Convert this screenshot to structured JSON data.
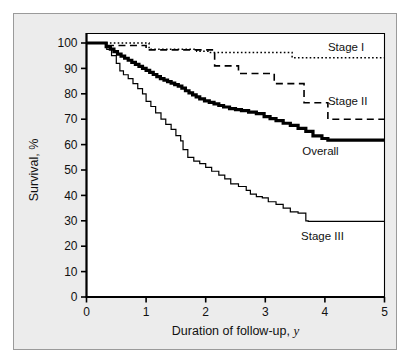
{
  "figure": {
    "background": "#ececec",
    "plot_background": "#ffffff",
    "border_color": "#9a9a9a"
  },
  "chart_data": {
    "type": "line",
    "title": "",
    "subtitle": "",
    "xlabel": "Duration of follow-up, y",
    "xlabel_italic_suffix": "y",
    "ylabel": "Survival, %",
    "xlim": [
      0,
      5
    ],
    "ylim": [
      0,
      100
    ],
    "xticks": [
      0,
      1,
      2,
      3,
      4,
      5
    ],
    "yticks": [
      0,
      10,
      20,
      30,
      40,
      50,
      60,
      70,
      80,
      90,
      100
    ],
    "xticklabels": [
      "0",
      "1",
      "2",
      "3",
      "4",
      "5"
    ],
    "yticklabels": [
      "0",
      "10",
      "20",
      "30",
      "40",
      "50",
      "60",
      "70",
      "80",
      "90",
      "100"
    ],
    "grid": false,
    "legend_position": "inline-annotations",
    "step_type": "post",
    "series": [
      {
        "name": "Stage I",
        "style": "dotted",
        "label": "Stage I",
        "label_x": 4.05,
        "label_y": 98.5,
        "x": [
          0.0,
          0.95,
          1.05,
          1.75,
          1.85,
          2.05,
          3.35,
          3.45,
          5.0
        ],
        "y": [
          100.0,
          100.0,
          97.5,
          97.5,
          96.8,
          96.3,
          96.3,
          94.2,
          94.2
        ]
      },
      {
        "name": "Stage II",
        "style": "dashed",
        "label": "Stage II",
        "label_x": 4.05,
        "label_y": 77.0,
        "x": [
          0.0,
          0.22,
          0.3,
          0.9,
          1.0,
          2.05,
          2.15,
          2.45,
          2.55,
          3.05,
          3.15,
          3.55,
          3.65,
          3.95,
          4.05,
          5.0
        ],
        "y": [
          100.0,
          100.0,
          99.0,
          99.0,
          97.3,
          97.3,
          91.0,
          91.0,
          88.0,
          88.0,
          84.0,
          84.0,
          76.5,
          76.5,
          70.0,
          70.0
        ]
      },
      {
        "name": "Overall",
        "style": "solid-thick",
        "label": "Overall",
        "label_x": 3.62,
        "label_y": 57.5,
        "x": [
          0.0,
          0.28,
          0.33,
          0.4,
          0.46,
          0.52,
          0.58,
          0.64,
          0.7,
          0.76,
          0.82,
          0.88,
          0.94,
          1.0,
          1.06,
          1.12,
          1.18,
          1.24,
          1.3,
          1.36,
          1.42,
          1.48,
          1.54,
          1.6,
          1.66,
          1.72,
          1.78,
          1.84,
          1.9,
          1.98,
          2.06,
          2.14,
          2.22,
          2.3,
          2.4,
          2.5,
          2.6,
          2.72,
          2.85,
          2.98,
          3.08,
          3.18,
          3.3,
          3.42,
          3.55,
          3.68,
          3.8,
          3.95,
          4.05,
          5.0
        ],
        "y": [
          100.0,
          100.0,
          98.6,
          97.6,
          96.6,
          95.6,
          94.8,
          94.0,
          93.2,
          92.4,
          91.6,
          90.8,
          90.0,
          89.2,
          88.4,
          87.6,
          86.8,
          86.0,
          85.4,
          84.8,
          84.2,
          83.6,
          83.0,
          82.2,
          81.2,
          80.4,
          79.6,
          78.8,
          78.0,
          77.2,
          76.6,
          76.0,
          75.4,
          74.8,
          74.2,
          73.8,
          73.4,
          72.8,
          72.2,
          71.0,
          70.2,
          69.4,
          68.4,
          67.6,
          66.4,
          65.2,
          63.4,
          62.4,
          61.8,
          61.8
        ]
      },
      {
        "name": "Stage III",
        "style": "solid-thin",
        "label": "Stage III",
        "label_x": 3.6,
        "label_y": 24.0,
        "x": [
          0.0,
          0.28,
          0.34,
          0.42,
          0.5,
          0.56,
          0.62,
          0.7,
          0.78,
          0.86,
          0.94,
          1.0,
          1.08,
          1.16,
          1.25,
          1.33,
          1.42,
          1.5,
          1.58,
          1.62,
          1.7,
          1.8,
          1.9,
          2.0,
          2.1,
          2.22,
          2.32,
          2.42,
          2.55,
          2.68,
          2.75,
          2.85,
          2.95,
          3.05,
          3.18,
          3.3,
          3.42,
          3.55,
          3.68,
          3.72,
          5.0
        ],
        "y": [
          100.0,
          100.0,
          97.5,
          95.0,
          92.0,
          89.0,
          87.5,
          86.0,
          84.0,
          82.0,
          80.0,
          77.0,
          75.0,
          72.5,
          70.0,
          68.0,
          66.0,
          63.5,
          61.5,
          58.0,
          55.0,
          53.5,
          52.5,
          51.0,
          49.5,
          48.0,
          46.5,
          44.5,
          43.5,
          42.0,
          40.5,
          39.5,
          39.0,
          37.5,
          36.5,
          35.0,
          33.5,
          33.0,
          30.0,
          29.8,
          29.8
        ]
      }
    ]
  }
}
